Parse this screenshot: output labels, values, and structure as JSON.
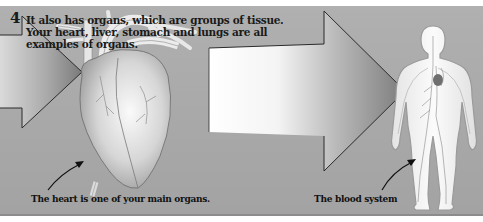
{
  "panel": {
    "step_number": "4",
    "heading": "It also has organs, which are groups of tissue. Your heart, liver, stomach and lungs are all examples of organs.",
    "captions": {
      "heart": "The heart is one of your main organs.",
      "blood_system": "The blood system"
    },
    "illustrations": [
      {
        "name": "heart-illustration",
        "label": "Heart"
      },
      {
        "name": "human-body-blood-system-illustration",
        "label": "Blood system"
      }
    ],
    "arrows": [
      "left-arrow",
      "center-arrow"
    ],
    "colors": {
      "background": "#a9a9a9",
      "text": "#1a1a1a",
      "outline": "#2b2b2b"
    }
  }
}
